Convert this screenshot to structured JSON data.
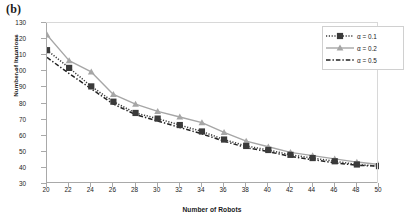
{
  "panel": {
    "label": "(b)"
  },
  "chart_data": {
    "type": "line",
    "title": "",
    "xlabel": "Number of Robots",
    "ylabel": "Number of Iterations",
    "x": [
      20,
      22,
      24,
      26,
      28,
      30,
      32,
      34,
      36,
      38,
      40,
      42,
      44,
      46,
      48,
      50
    ],
    "xlim": [
      20,
      50
    ],
    "ylim": [
      30,
      130
    ],
    "xticks": [
      20,
      22,
      24,
      26,
      28,
      30,
      32,
      34,
      36,
      38,
      40,
      42,
      44,
      46,
      48,
      50
    ],
    "yticks": [
      30,
      40,
      50,
      60,
      70,
      80,
      90,
      100,
      110,
      120,
      130
    ],
    "grid": false,
    "legend_position": "top-right",
    "series": [
      {
        "name": "α = 0.1",
        "color": "#3a3a3a",
        "linestyle": "dotted",
        "marker": "square",
        "values": [
          112.5,
          101.5,
          90,
          80.5,
          73.5,
          70,
          66,
          62,
          57,
          53,
          50.5,
          47.5,
          45.5,
          43.5,
          41.5,
          40.5
        ]
      },
      {
        "name": "α = 0.2",
        "color": "#a6a6a6",
        "linestyle": "solid",
        "marker": "triangle",
        "values": [
          122,
          106,
          99,
          85,
          79,
          74.5,
          71,
          67.5,
          61.5,
          56,
          52.5,
          49,
          47,
          45,
          43,
          41.5
        ]
      },
      {
        "name": "α = 0.5",
        "color": "#222222",
        "linestyle": "dashed",
        "marker": "none",
        "values": [
          108,
          98,
          88.5,
          79,
          72.5,
          68.5,
          64.5,
          60.5,
          56,
          52,
          49.5,
          46.5,
          44.5,
          42.5,
          41,
          40.5
        ]
      }
    ]
  }
}
